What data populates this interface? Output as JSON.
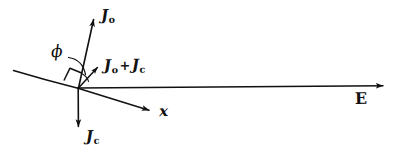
{
  "figure": {
    "kind": "hand-drawn-vector-diagram",
    "background_color": "#ffffff",
    "ink_color": "#111111",
    "width": 404,
    "height": 162
  },
  "labels": {
    "j_zero": {
      "base": "J",
      "sub": "o",
      "text": "Jo"
    },
    "j_sum": {
      "base_a": "J",
      "sub_a": "o",
      "operator": "+",
      "base_b": "J",
      "sub_b": "c",
      "text": "Jo + Jc"
    },
    "j_c": {
      "base": "J",
      "sub": "c",
      "text": "Jc"
    },
    "phi": {
      "text": "ϕ"
    },
    "x_axis": {
      "text": "x"
    },
    "e_field": {
      "text": "E"
    }
  },
  "geometry": {
    "origin": {
      "x": 78,
      "y": 88
    },
    "vectors": [
      {
        "name": "J-zero-arrow",
        "from": [
          78,
          88
        ],
        "to": [
          95,
          17
        ],
        "label": "Jo"
      },
      {
        "name": "J-sum-arrow",
        "from": [
          78,
          88
        ],
        "to": [
          100,
          65
        ],
        "label": "Jo + Jc"
      },
      {
        "name": "J-c-arrow",
        "from": [
          78,
          88
        ],
        "to": [
          78,
          131
        ],
        "label": "Jc"
      },
      {
        "name": "x-axis-arrow",
        "from": [
          78,
          88
        ],
        "to": [
          152,
          111
        ],
        "label": "x"
      },
      {
        "name": "e-field-arrow",
        "from": [
          86,
          88
        ],
        "to": [
          386,
          86
        ],
        "label": "E"
      }
    ],
    "surface_line": {
      "from": [
        13,
        71
      ],
      "to": [
        152,
        111
      ]
    },
    "right_angle_marker": {
      "at": [
        78,
        88
      ],
      "size": 13
    },
    "phi_arc": {
      "from": [
        70,
        58
      ],
      "to": [
        86,
        76
      ]
    }
  }
}
